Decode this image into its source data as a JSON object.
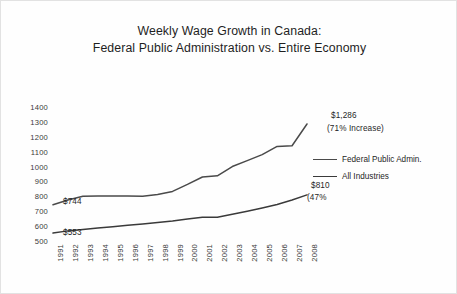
{
  "chart_data": {
    "type": "line",
    "title": "Weekly Wage Growth in Canada:",
    "subtitle": "Federal Public Administration vs.  Entire Economy",
    "xlabel": "",
    "ylabel": "",
    "ylim": [
      500,
      1400
    ],
    "yticks": [
      1400,
      1300,
      1200,
      1100,
      1000,
      900,
      800,
      700,
      600,
      500
    ],
    "grid": false,
    "legend_position": "right",
    "categories": [
      "1991",
      "1992",
      "1993",
      "1994",
      "1995",
      "1996",
      "1997",
      "1998",
      "1999",
      "2000",
      "2001",
      "2002",
      "2003",
      "2004",
      "2005",
      "2006",
      "2007",
      "2008"
    ],
    "series": [
      {
        "name": "Federal Public Admin.",
        "color": "#4a4a4a",
        "values": [
          744,
          775,
          800,
          803,
          803,
          803,
          800,
          812,
          833,
          880,
          930,
          938,
          1000,
          1040,
          1080,
          1135,
          1140,
          1286
        ]
      },
      {
        "name": "All Industries",
        "color": "#3a3a3a",
        "values": [
          553,
          568,
          578,
          588,
          596,
          605,
          615,
          625,
          635,
          648,
          660,
          660,
          680,
          700,
          722,
          745,
          775,
          810
        ]
      }
    ],
    "annotations": [
      {
        "name": "federal-start",
        "text": "$744",
        "series": "Federal Public Admin.",
        "x": "1991",
        "y": 744
      },
      {
        "name": "all-industries-start",
        "text": "$553",
        "series": "All Industries",
        "x": "1991",
        "y": 553
      },
      {
        "name": "federal-end-value",
        "text": "$1,286",
        "series": "Federal Public Admin.",
        "x": "2008",
        "y": 1286
      },
      {
        "name": "federal-end-percent",
        "text": "(71% Increase)",
        "series": "Federal Public Admin.",
        "x": "2008",
        "y": 1286
      },
      {
        "name": "all-industries-end-value",
        "text": "$810",
        "series": "All Industries",
        "x": "2008",
        "y": 810
      },
      {
        "name": "all-industries-end-percent",
        "text": "(47%",
        "series": "All Industries",
        "x": "2008",
        "y": 810
      }
    ]
  },
  "legend": {
    "items": [
      {
        "label": "Federal Public Admin.",
        "color": "#4a4a4a"
      },
      {
        "label": "All Industries",
        "color": "#3a3a3a"
      }
    ]
  }
}
